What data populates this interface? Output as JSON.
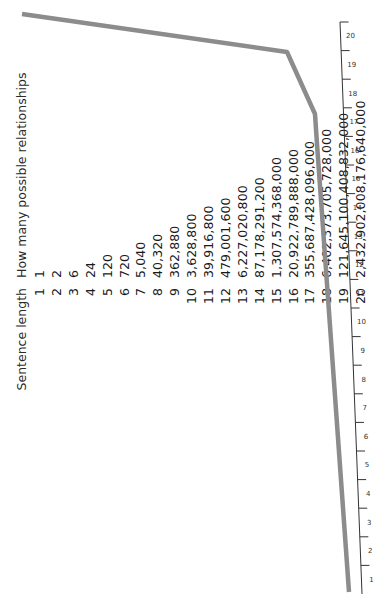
{
  "table": {
    "headers": {
      "length": "Sentence length",
      "relationships": "How many possible relationships"
    },
    "rows": [
      {
        "n": "1",
        "value": "1"
      },
      {
        "n": "2",
        "value": "2"
      },
      {
        "n": "3",
        "value": "6"
      },
      {
        "n": "4",
        "value": "24"
      },
      {
        "n": "5",
        "value": "120"
      },
      {
        "n": "6",
        "value": "720"
      },
      {
        "n": "7",
        "value": "5,040"
      },
      {
        "n": "8",
        "value": "40,320"
      },
      {
        "n": "9",
        "value": "362,880"
      },
      {
        "n": "10",
        "value": "3,628,800"
      },
      {
        "n": "11",
        "value": "39,916,800"
      },
      {
        "n": "12",
        "value": "479,001,600"
      },
      {
        "n": "13",
        "value": "6,227,020,800"
      },
      {
        "n": "14",
        "value": "87,178,291,200"
      },
      {
        "n": "15",
        "value": "1,307,574,368,000"
      },
      {
        "n": "16",
        "value": "20,922,789,888,000"
      },
      {
        "n": "17",
        "value": "355,687,428,096,000"
      },
      {
        "n": "18",
        "value": "6,402,373,705,728,000"
      },
      {
        "n": "19",
        "value": "121,645,100,408,832,000"
      },
      {
        "n": "20",
        "value": "2,432,902,008,176,640,000"
      }
    ]
  },
  "chart_data": {
    "type": "line",
    "title": "",
    "xlabel": "Sentence length",
    "ylabel": "How many possible relationships",
    "x": [
      1,
      2,
      3,
      4,
      5,
      6,
      7,
      8,
      9,
      10,
      11,
      12,
      13,
      14,
      15,
      16,
      17,
      18,
      19,
      20
    ],
    "series": [
      {
        "name": "How many possible relationships (n!)",
        "values": [
          1,
          2,
          6,
          24,
          120,
          720,
          5040,
          40320,
          362880,
          3628800,
          39916800,
          479001600,
          6227020800,
          87178291200,
          1307574368000,
          20922789888000,
          355687428096000,
          6402373705728000,
          121645100408832000,
          2432902008176640000
        ]
      }
    ],
    "axis_ticks": [
      "1",
      "2",
      "3",
      "4",
      "5",
      "6",
      "7",
      "8",
      "9",
      "10",
      "11",
      "12",
      "13",
      "14",
      "15",
      "16",
      "17",
      "18",
      "19",
      "20"
    ],
    "grid": false,
    "legend": "none",
    "orientation": "rotated -90deg",
    "colors": {
      "line": "#8c8c8c",
      "axis": "#333333"
    }
  }
}
